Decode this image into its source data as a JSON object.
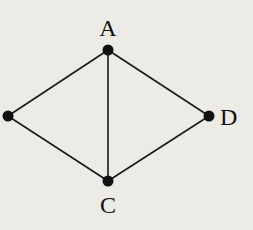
{
  "diagram": {
    "type": "graph",
    "vertices": [
      {
        "id": "A",
        "label": "A"
      },
      {
        "id": "B",
        "label": ""
      },
      {
        "id": "C",
        "label": "C"
      },
      {
        "id": "D",
        "label": "D"
      }
    ],
    "edges": [
      {
        "from": "A",
        "to": "B"
      },
      {
        "from": "A",
        "to": "C"
      },
      {
        "from": "A",
        "to": "D"
      },
      {
        "from": "B",
        "to": "C"
      },
      {
        "from": "C",
        "to": "D"
      }
    ]
  }
}
